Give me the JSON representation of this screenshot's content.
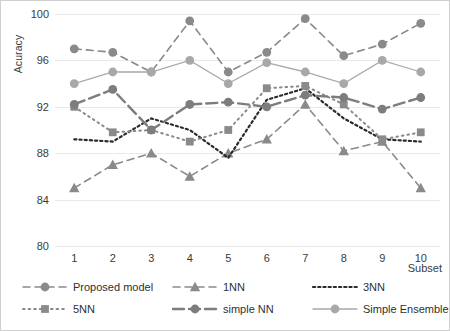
{
  "chart_data": {
    "type": "line",
    "title": "",
    "xlabel": "Subset",
    "ylabel": "Acuracy",
    "categories": [
      "1",
      "2",
      "3",
      "4",
      "5",
      "6",
      "7",
      "8",
      "9",
      "10"
    ],
    "ylim": [
      80,
      100
    ],
    "yticks": [
      80,
      84,
      88,
      92,
      96,
      100
    ],
    "grid": true,
    "legend_position": "bottom",
    "series": [
      {
        "name": "Proposed model",
        "color": "#8a8a8a",
        "marker": "circle",
        "linestyle": "dashed",
        "values": [
          97.0,
          96.7,
          95.0,
          99.4,
          95.0,
          96.7,
          99.6,
          96.4,
          97.4,
          99.2
        ]
      },
      {
        "name": "1NN",
        "color": "#8a8a8a",
        "marker": "triangle",
        "linestyle": "dashed",
        "values": [
          85.0,
          87.0,
          88.0,
          86.0,
          88.0,
          89.2,
          92.2,
          88.2,
          89.0,
          85.0
        ]
      },
      {
        "name": "3NN",
        "color": "#2b2b2b",
        "marker": "none",
        "linestyle": "dotted",
        "values": [
          89.2,
          89.0,
          91.0,
          90.0,
          87.6,
          92.6,
          93.6,
          91.0,
          89.2,
          89.0
        ]
      },
      {
        "name": "5NN",
        "color": "#8a8a8a",
        "marker": "square",
        "linestyle": "solid-dotted",
        "values": [
          92.0,
          89.8,
          90.0,
          89.0,
          90.0,
          93.6,
          93.8,
          92.2,
          89.2,
          89.8
        ]
      },
      {
        "name": "simple NN",
        "color": "#7d7d7d",
        "marker": "circle",
        "linestyle": "long-dash",
        "values": [
          92.2,
          93.5,
          90.0,
          92.2,
          92.4,
          92.0,
          93.0,
          92.8,
          91.8,
          92.8
        ]
      },
      {
        "name": "Simple Ensemble",
        "color": "#a8a8a8",
        "marker": "circle",
        "linestyle": "solid",
        "values": [
          94.0,
          95.0,
          95.0,
          96.0,
          94.0,
          95.8,
          95.0,
          94.0,
          96.0,
          95.0
        ]
      }
    ]
  },
  "axes": {
    "y_title": "Acuracy",
    "x_title": "Subset"
  }
}
